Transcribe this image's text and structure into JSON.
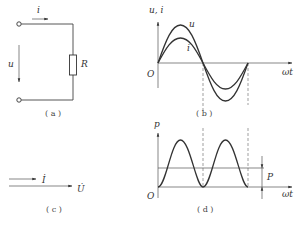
{
  "diagram": {
    "panel_a": {
      "caption": "( a )",
      "current_label": "i",
      "voltage_label": "u",
      "resistor_label": "R"
    },
    "panel_b": {
      "caption": "( b )",
      "y_axis_label": "u, i",
      "x_axis_label": "ωt",
      "origin_label": "O",
      "curve_u_label": "u",
      "curve_i_label": "i"
    },
    "panel_c": {
      "caption": "( c )",
      "current_phasor_label": "İ",
      "voltage_phasor_label": "U̇"
    },
    "panel_d": {
      "caption": "( d )",
      "y_axis_label": "p",
      "x_axis_label": "ωt",
      "origin_label": "O",
      "average_power_label": "P"
    }
  }
}
